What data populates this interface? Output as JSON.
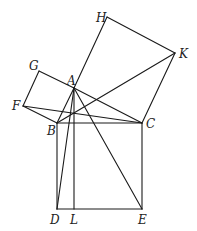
{
  "diagram": {
    "points": {
      "A": {
        "x": 74,
        "y": 88,
        "label": "A",
        "lx": 67,
        "ly": 85
      },
      "B": {
        "x": 57,
        "y": 123,
        "label": "B",
        "lx": 47,
        "ly": 135
      },
      "C": {
        "x": 142,
        "y": 123,
        "label": "C",
        "lx": 146,
        "ly": 128
      },
      "D": {
        "x": 57,
        "y": 209,
        "label": "D",
        "lx": 50,
        "ly": 224
      },
      "L": {
        "x": 74,
        "y": 209,
        "label": "L",
        "lx": 70,
        "ly": 224
      },
      "E": {
        "x": 142,
        "y": 209,
        "label": "E",
        "lx": 138,
        "ly": 224
      },
      "F": {
        "x": 23,
        "y": 106,
        "label": "F",
        "lx": 12,
        "ly": 110
      },
      "G": {
        "x": 39,
        "y": 71,
        "label": "G",
        "lx": 29,
        "ly": 70
      },
      "H": {
        "x": 107,
        "y": 17,
        "label": "H",
        "lx": 96,
        "ly": 22
      },
      "K": {
        "x": 175,
        "y": 53,
        "label": "K",
        "lx": 179,
        "ly": 58
      }
    },
    "segments": [
      [
        "A",
        "B"
      ],
      [
        "B",
        "C"
      ],
      [
        "C",
        "A"
      ],
      [
        "B",
        "D"
      ],
      [
        "D",
        "E"
      ],
      [
        "E",
        "C"
      ],
      [
        "A",
        "H"
      ],
      [
        "H",
        "K"
      ],
      [
        "K",
        "C"
      ],
      [
        "A",
        "G"
      ],
      [
        "G",
        "F"
      ],
      [
        "F",
        "B"
      ],
      [
        "A",
        "L"
      ],
      [
        "A",
        "D"
      ],
      [
        "A",
        "E"
      ],
      [
        "F",
        "C"
      ],
      [
        "B",
        "K"
      ]
    ],
    "labels": [
      "A",
      "B",
      "C",
      "D",
      "L",
      "E",
      "F",
      "G",
      "H",
      "K"
    ]
  }
}
